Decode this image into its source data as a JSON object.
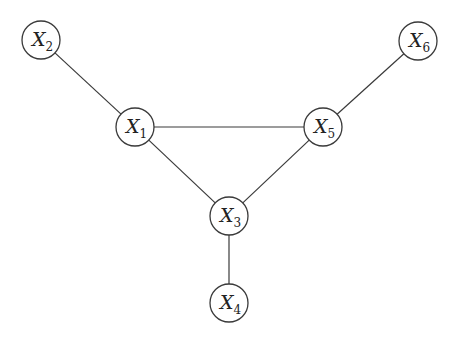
{
  "diagram": {
    "type": "undirected-graph",
    "nodes": [
      {
        "id": "X1",
        "base": "X",
        "sub": "1",
        "x": 135,
        "y": 127
      },
      {
        "id": "X2",
        "base": "X",
        "sub": "2",
        "x": 41,
        "y": 40
      },
      {
        "id": "X3",
        "base": "X",
        "sub": "3",
        "x": 229,
        "y": 216
      },
      {
        "id": "X4",
        "base": "X",
        "sub": "4",
        "x": 229,
        "y": 303
      },
      {
        "id": "X5",
        "base": "X",
        "sub": "5",
        "x": 323,
        "y": 127
      },
      {
        "id": "X6",
        "base": "X",
        "sub": "6",
        "x": 418,
        "y": 41
      }
    ],
    "edges": [
      {
        "from": "X2",
        "to": "X1"
      },
      {
        "from": "X1",
        "to": "X5"
      },
      {
        "from": "X1",
        "to": "X3"
      },
      {
        "from": "X5",
        "to": "X3"
      },
      {
        "from": "X6",
        "to": "X5"
      },
      {
        "from": "X3",
        "to": "X4"
      }
    ],
    "node_radius": 19,
    "colors": {
      "stroke": "#3a3a3a",
      "fill": "#ffffff",
      "text": "#222222"
    }
  }
}
